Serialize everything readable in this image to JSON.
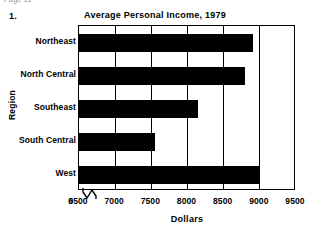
{
  "page": {
    "header_fragment": "Page 11",
    "item_number": "1."
  },
  "axis_break_icon": "axis-break-icon",
  "chart_data": {
    "type": "bar",
    "orientation": "horizontal",
    "title": "Average Personal Income, 1979",
    "xlabel": "Dollars",
    "ylabel": "Region",
    "categories": [
      "Northeast",
      "North Central",
      "Southeast",
      "South Central",
      "West"
    ],
    "values": [
      8900,
      8800,
      8150,
      7550,
      9000
    ],
    "xticks": [
      0,
      6500,
      7000,
      7500,
      8000,
      8500,
      9000,
      9500
    ],
    "xtick_labels": [
      "0",
      "6500",
      "7000",
      "7500",
      "8000",
      "8500",
      "9000",
      "9500"
    ],
    "xlim": [
      6500,
      9500
    ],
    "axis_break": true,
    "axis_break_after": 0,
    "grid": true,
    "grid_axis": "x",
    "legend": false,
    "bar_color": "#000000",
    "background_color": "#ffffff",
    "frame_color": "#000000"
  }
}
